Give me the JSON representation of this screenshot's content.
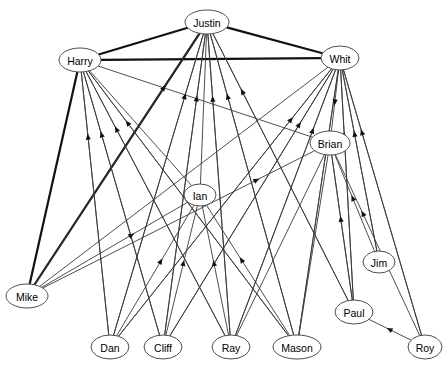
{
  "figure": {
    "title": "",
    "type": "directed-network-graph",
    "width": 444,
    "height": 369,
    "background_color": "#ffffff"
  },
  "style": {
    "node_fill": "#ffffff",
    "node_stroke": "#4d4d4d",
    "node_text_color": "#000000",
    "thin_edge_color": "#3a3a3a",
    "thick_edge_color": "#111111",
    "arrow_color": "#111111"
  },
  "chart_data": {
    "type": "diagram",
    "subtype": "directed graph",
    "title": "",
    "node_count": 14,
    "nodes": [
      {
        "id": "Justin",
        "label": "Justin",
        "x": 207,
        "y": 22,
        "rx": 22,
        "ry": 12,
        "role": "hub"
      },
      {
        "id": "Harry",
        "label": "Harry",
        "x": 80,
        "y": 60,
        "rx": 21,
        "ry": 12,
        "role": "hub"
      },
      {
        "id": "Whit",
        "label": "Whit",
        "x": 340,
        "y": 58,
        "rx": 19,
        "ry": 12,
        "role": "hub"
      },
      {
        "id": "Brian",
        "label": "Brian",
        "x": 330,
        "y": 143,
        "rx": 20,
        "ry": 12,
        "role": "mid"
      },
      {
        "id": "Ian",
        "label": "Ian",
        "x": 200,
        "y": 195,
        "rx": 16,
        "ry": 11,
        "role": "mid"
      },
      {
        "id": "Jim",
        "label": "Jim",
        "x": 379,
        "y": 262,
        "rx": 16,
        "ry": 11,
        "role": "mid"
      },
      {
        "id": "Mike",
        "label": "Mike",
        "x": 27,
        "y": 296,
        "rx": 21,
        "ry": 12,
        "role": "leaf"
      },
      {
        "id": "Paul",
        "label": "Paul",
        "x": 354,
        "y": 312,
        "rx": 19,
        "ry": 12,
        "role": "leaf"
      },
      {
        "id": "Dan",
        "label": "Dan",
        "x": 110,
        "y": 347,
        "rx": 19,
        "ry": 12,
        "role": "leaf"
      },
      {
        "id": "Cliff",
        "label": "Cliff",
        "x": 163,
        "y": 347,
        "rx": 19,
        "ry": 12,
        "role": "leaf"
      },
      {
        "id": "Ray",
        "label": "Ray",
        "x": 231,
        "y": 347,
        "rx": 19,
        "ry": 12,
        "role": "leaf"
      },
      {
        "id": "Mason",
        "label": "Mason",
        "x": 297,
        "y": 347,
        "rx": 24,
        "ry": 12,
        "role": "leaf"
      },
      {
        "id": "Roy",
        "label": "Roy",
        "x": 425,
        "y": 347,
        "rx": 17,
        "ry": 12,
        "role": "leaf"
      },
      {
        "id": "Jim2",
        "label": "",
        "x": -100,
        "y": -100,
        "rx": 0,
        "ry": 0,
        "role": "hidden"
      }
    ],
    "edges": [
      {
        "from": "Harry",
        "to": "Justin",
        "weight": "thick",
        "arrow": false
      },
      {
        "from": "Justin",
        "to": "Whit",
        "weight": "thick",
        "arrow": false
      },
      {
        "from": "Harry",
        "to": "Whit",
        "weight": "thick",
        "arrow": false
      },
      {
        "from": "Harry",
        "to": "Mike",
        "weight": "thick",
        "arrow": false
      },
      {
        "from": "Justin",
        "to": "Mike",
        "weight": "thick",
        "arrow": false
      },
      {
        "from": "Mike",
        "to": "Justin",
        "weight": "thin",
        "arrow": true
      },
      {
        "from": "Mike",
        "to": "Brian",
        "weight": "thin",
        "arrow": true
      },
      {
        "from": "Dan",
        "to": "Harry",
        "weight": "thin",
        "arrow": true
      },
      {
        "from": "Dan",
        "to": "Justin",
        "weight": "thin",
        "arrow": true
      },
      {
        "from": "Dan",
        "to": "Whit",
        "weight": "thin",
        "arrow": true
      },
      {
        "from": "Cliff",
        "to": "Harry",
        "weight": "thin",
        "arrow": true
      },
      {
        "from": "Cliff",
        "to": "Justin",
        "weight": "thin",
        "arrow": true
      },
      {
        "from": "Cliff",
        "to": "Whit",
        "weight": "thin",
        "arrow": true
      },
      {
        "from": "Ray",
        "to": "Harry",
        "weight": "thin",
        "arrow": true
      },
      {
        "from": "Ray",
        "to": "Justin",
        "weight": "thin",
        "arrow": true
      },
      {
        "from": "Ray",
        "to": "Whit",
        "weight": "thin",
        "arrow": true
      },
      {
        "from": "Mason",
        "to": "Harry",
        "weight": "thin",
        "arrow": true
      },
      {
        "from": "Mason",
        "to": "Justin",
        "weight": "thin",
        "arrow": true
      },
      {
        "from": "Mason",
        "to": "Whit",
        "weight": "thin",
        "arrow": true
      },
      {
        "from": "Paul",
        "to": "Justin",
        "weight": "thin",
        "arrow": true
      },
      {
        "from": "Paul",
        "to": "Whit",
        "weight": "thin",
        "arrow": true
      },
      {
        "from": "Paul",
        "to": "Brian",
        "weight": "thin",
        "arrow": true
      },
      {
        "from": "Jim",
        "to": "Whit",
        "weight": "thin",
        "arrow": true
      },
      {
        "from": "Jim",
        "to": "Brian",
        "weight": "thin",
        "arrow": true
      },
      {
        "from": "Roy",
        "to": "Whit",
        "weight": "thin",
        "arrow": true
      },
      {
        "from": "Roy",
        "to": "Brian",
        "weight": "thin",
        "arrow": true
      },
      {
        "from": "Roy",
        "to": "Paul",
        "weight": "thin",
        "arrow": true
      },
      {
        "from": "Whit",
        "to": "Brian",
        "weight": "thin",
        "arrow": true
      },
      {
        "from": "Harry",
        "to": "Ian",
        "weight": "thin",
        "arrow": false
      },
      {
        "from": "Dan",
        "to": "Ian",
        "weight": "thin",
        "arrow": true
      },
      {
        "from": "Cliff",
        "to": "Ian",
        "weight": "thin",
        "arrow": true
      },
      {
        "from": "Ray",
        "to": "Ian",
        "weight": "thin",
        "arrow": true
      },
      {
        "from": "Mason",
        "to": "Ian",
        "weight": "thin",
        "arrow": true
      },
      {
        "from": "Mike",
        "to": "Ian",
        "weight": "thin",
        "arrow": true
      },
      {
        "from": "Harry",
        "to": "Dan",
        "weight": "thin",
        "arrow": false
      },
      {
        "from": "Harry",
        "to": "Cliff",
        "weight": "thin",
        "arrow": false
      },
      {
        "from": "Harry",
        "to": "Ray",
        "weight": "thin",
        "arrow": false
      },
      {
        "from": "Harry",
        "to": "Mason",
        "weight": "thin",
        "arrow": false
      },
      {
        "from": "Harry",
        "to": "Brian",
        "weight": "thin",
        "arrow": false
      },
      {
        "from": "Justin",
        "to": "Dan",
        "weight": "thin",
        "arrow": false
      },
      {
        "from": "Justin",
        "to": "Cliff",
        "weight": "thin",
        "arrow": false
      },
      {
        "from": "Justin",
        "to": "Ray",
        "weight": "thin",
        "arrow": false
      },
      {
        "from": "Justin",
        "to": "Mason",
        "weight": "thin",
        "arrow": false
      },
      {
        "from": "Justin",
        "to": "Paul",
        "weight": "thin",
        "arrow": false
      },
      {
        "from": "Justin",
        "to": "Ian",
        "weight": "thin",
        "arrow": false
      },
      {
        "from": "Whit",
        "to": "Dan",
        "weight": "thin",
        "arrow": false
      },
      {
        "from": "Whit",
        "to": "Cliff",
        "weight": "thin",
        "arrow": false
      },
      {
        "from": "Whit",
        "to": "Ray",
        "weight": "thin",
        "arrow": false
      },
      {
        "from": "Whit",
        "to": "Mason",
        "weight": "thin",
        "arrow": false
      },
      {
        "from": "Whit",
        "to": "Mike",
        "weight": "thin",
        "arrow": false
      },
      {
        "from": "Whit",
        "to": "Paul",
        "weight": "thin",
        "arrow": false
      },
      {
        "from": "Whit",
        "to": "Jim",
        "weight": "thin",
        "arrow": false
      },
      {
        "from": "Whit",
        "to": "Roy",
        "weight": "thin",
        "arrow": false
      },
      {
        "from": "Brian",
        "to": "Mason",
        "weight": "thin",
        "arrow": false
      },
      {
        "from": "Brian",
        "to": "Paul",
        "weight": "thin",
        "arrow": false
      },
      {
        "from": "Brian",
        "to": "Ray",
        "weight": "thin",
        "arrow": false
      }
    ]
  }
}
